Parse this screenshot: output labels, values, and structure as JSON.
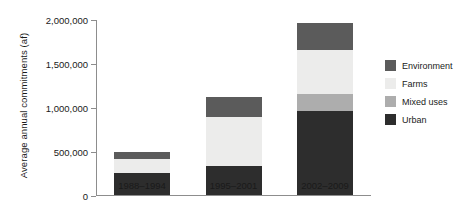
{
  "chart_data": {
    "type": "bar",
    "title": "",
    "subtitle": "",
    "xlabel": "",
    "ylabel": "Average annual commitments (af)",
    "stacked": true,
    "grid": false,
    "legend_position": "right",
    "ylim": [
      0,
      2000000
    ],
    "ytick_values": [
      0,
      500000,
      1000000,
      1500000,
      2000000
    ],
    "ytick_labels": [
      "0",
      "500,000",
      "1,000,000",
      "1,500,000",
      "2,000,000"
    ],
    "categories": [
      "1988–1994",
      "1995–2001",
      "2002–2009"
    ],
    "series": [
      {
        "name": "Urban",
        "color": "#2d2d2d",
        "values": [
          250000,
          330000,
          955000
        ]
      },
      {
        "name": "Mixed uses",
        "color": "#adadad",
        "values": [
          0,
          0,
          190000
        ]
      },
      {
        "name": "Farms",
        "color": "#ececeb",
        "values": [
          160000,
          560000,
          500000
        ]
      },
      {
        "name": "Environment",
        "color": "#5b5b5b",
        "values": [
          80000,
          225000,
          305000
        ]
      }
    ],
    "totals": [
      490000,
      1115000,
      1950000
    ]
  },
  "legend": {
    "items": [
      {
        "label": "Environment",
        "color": "#5b5b5b"
      },
      {
        "label": "Farms",
        "color": "#ececeb"
      },
      {
        "label": "Mixed uses",
        "color": "#adadad"
      },
      {
        "label": "Urban",
        "color": "#2d2d2d"
      }
    ]
  }
}
